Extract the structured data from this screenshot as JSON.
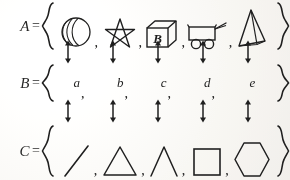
{
  "figure": {
    "background_color": "#f2f1ee",
    "ink_color": "#232323",
    "type": "set-correspondence-diagram"
  },
  "rows": [
    {
      "label": "A",
      "equals": "=",
      "open_brace": "{",
      "close_brace": "}",
      "items": [
        {
          "name": "sphere",
          "separator": ","
        },
        {
          "name": "five-pointed-star",
          "separator": ","
        },
        {
          "name": "cube-with-letter-B",
          "face_label": "B",
          "separator": ","
        },
        {
          "name": "two-wheeled-cart",
          "separator": ","
        },
        {
          "name": "pyramid",
          "separator": ""
        }
      ]
    },
    {
      "label": "B",
      "equals": "=",
      "open_brace": "{",
      "close_brace": "}",
      "items": [
        {
          "name": "letter-a",
          "text": "a",
          "separator": ","
        },
        {
          "name": "letter-b",
          "text": "b",
          "separator": ","
        },
        {
          "name": "letter-c",
          "text": "c",
          "separator": ","
        },
        {
          "name": "letter-d",
          "text": "d",
          "separator": ","
        },
        {
          "name": "letter-e",
          "text": "e",
          "separator": ""
        }
      ]
    },
    {
      "label": "C",
      "equals": "=",
      "open_brace": "{",
      "close_brace": "}",
      "items": [
        {
          "name": "diagonal-line-segment",
          "separator": ","
        },
        {
          "name": "triangle",
          "separator": ","
        },
        {
          "name": "open-angle-caret",
          "separator": ","
        },
        {
          "name": "square",
          "separator": ","
        },
        {
          "name": "hexagon",
          "separator": ""
        }
      ]
    }
  ],
  "arrows": {
    "a_to_b": {
      "name": "double-headed-arrow",
      "count": 5,
      "direction": "vertical-bidirectional"
    },
    "b_to_c": {
      "name": "double-headed-arrow",
      "count": 5,
      "direction": "vertical-bidirectional"
    }
  }
}
